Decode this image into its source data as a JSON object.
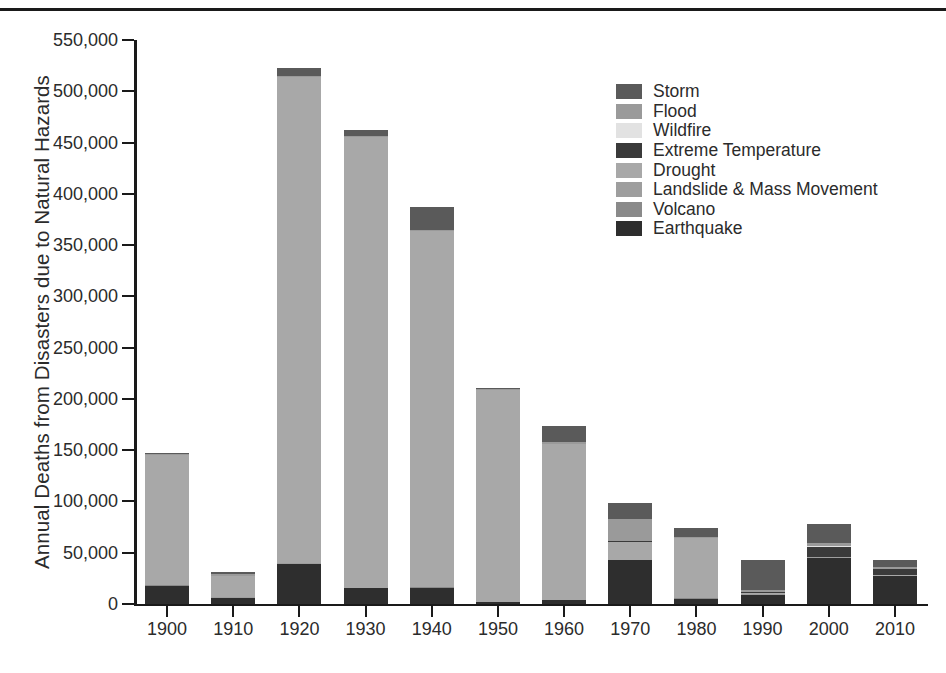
{
  "chart_data": {
    "type": "bar",
    "stacked": true,
    "title": "",
    "xlabel": "",
    "ylabel": "Annual Deaths from Disasters due to Natural Hazards",
    "ylim": [
      0,
      550000
    ],
    "ytick_values": [
      0,
      50000,
      100000,
      150000,
      200000,
      250000,
      300000,
      350000,
      400000,
      450000,
      500000,
      550000
    ],
    "ytick_labels": [
      "0",
      "50,000",
      "100,000",
      "150,000",
      "200,000",
      "250,000",
      "300,000",
      "350,000",
      "400,000",
      "450,000",
      "500,000",
      "550,000"
    ],
    "categories": [
      "1900",
      "1910",
      "1920",
      "1930",
      "1940",
      "1950",
      "1960",
      "1970",
      "1980",
      "1990",
      "2000",
      "2010"
    ],
    "grid": false,
    "legend_position": "upper right",
    "stack_order_bottom_to_top": [
      "Earthquake",
      "Volcano",
      "Landslide & Mass Movement",
      "Drought",
      "Extreme Temperature",
      "Wildfire",
      "Flood",
      "Storm"
    ],
    "series": [
      {
        "name": "Earthquake",
        "color": "#2e2e2e",
        "values": [
          18000,
          6000,
          39000,
          15500,
          16000,
          2000,
          4000,
          42500,
          5000,
          9000,
          45000,
          27000
        ]
      },
      {
        "name": "Volcano",
        "color": "#8a8a8a",
        "values": [
          700,
          200,
          300,
          200,
          150,
          100,
          100,
          100,
          700,
          200,
          200,
          100
        ]
      },
      {
        "name": "Landslide & Mass Movement",
        "color": "#9e9e9e",
        "values": [
          300,
          300,
          400,
          300,
          300,
          300,
          300,
          300,
          400,
          400,
          500,
          400
        ]
      },
      {
        "name": "Drought",
        "color": "#a8a8a8",
        "values": [
          126000,
          21000,
          474000,
          439000,
          347000,
          206000,
          152000,
          18000,
          58000,
          1500,
          600,
          500
        ]
      },
      {
        "name": "Extreme Temperature",
        "color": "#3a3a3a",
        "values": [
          0,
          0,
          0,
          0,
          0,
          0,
          0,
          200,
          300,
          400,
          9500,
          6000
        ]
      },
      {
        "name": "Wildfire",
        "color": "#e2e2e2",
        "values": [
          100,
          100,
          100,
          100,
          100,
          100,
          100,
          200,
          300,
          300,
          300,
          300
        ]
      },
      {
        "name": "Flood",
        "color": "#9a9a9a",
        "values": [
          1000,
          1500,
          1500,
          1500,
          1500,
          1000,
          1500,
          22000,
          500,
          1500,
          3500,
          1500
        ]
      },
      {
        "name": "Storm",
        "color": "#5a5a5a",
        "values": [
          1000,
          2000,
          7500,
          5500,
          22000,
          1000,
          15500,
          15000,
          9000,
          30000,
          18000,
          7500
        ]
      }
    ],
    "totals": [
      147100,
      31100,
      522800,
      462100,
      387050,
      210500,
      173500,
      98300,
      74200,
      43300,
      77600,
      43300
    ]
  },
  "legend": {
    "items": [
      {
        "label": "Storm",
        "color": "#5a5a5a"
      },
      {
        "label": "Flood",
        "color": "#9a9a9a"
      },
      {
        "label": "Wildfire",
        "color": "#e2e2e2"
      },
      {
        "label": "Extreme Temperature",
        "color": "#3a3a3a"
      },
      {
        "label": "Drought",
        "color": "#a8a8a8"
      },
      {
        "label": "Landslide & Mass Movement",
        "color": "#9e9e9e"
      },
      {
        "label": "Volcano",
        "color": "#8a8a8a"
      },
      {
        "label": "Earthquake",
        "color": "#2e2e2e"
      }
    ]
  }
}
